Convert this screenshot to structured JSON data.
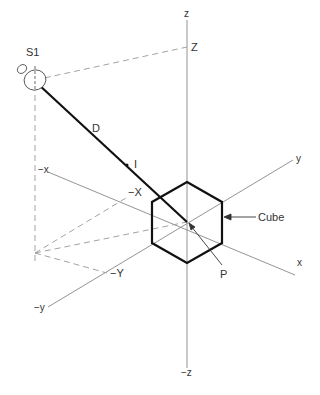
{
  "labels": {
    "source": "S1",
    "distance": "D",
    "intensity": "I",
    "z_pos": "z",
    "z_neg": "−z",
    "y_pos": "y",
    "y_neg": "−y",
    "x_pos": "x",
    "x_neg": "−x",
    "Z_proj": "Z",
    "X_proj": "−X",
    "Y_proj": "−Y",
    "cube": "Cube",
    "point": "P"
  },
  "colors": {
    "axis": "#888888",
    "bold": "#111111",
    "dash": "#999999"
  }
}
